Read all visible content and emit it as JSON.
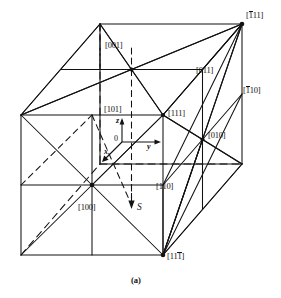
{
  "figure": {
    "caption": "(a)",
    "type": "crystallographic-direction-cube",
    "line_color": "#121212",
    "background_color": "#ffffff"
  },
  "axes": {
    "origin_label": "0",
    "z_label": "z",
    "y_label": "y",
    "x_label": "x",
    "s_label": "S"
  },
  "directions": [
    {
      "id": "d001",
      "prefix": "[",
      "a": "0",
      "a_bar": false,
      "b": "0",
      "b_bar": false,
      "c": "1",
      "c_bar": false,
      "suffix": "]",
      "text": "[001]"
    },
    {
      "id": "d101",
      "prefix": "[",
      "a": "1",
      "a_bar": false,
      "b": "0",
      "b_bar": false,
      "c": "1",
      "c_bar": false,
      "suffix": "]",
      "text": "[101]"
    },
    {
      "id": "d111",
      "prefix": "[",
      "a": "1",
      "a_bar": false,
      "b": "1",
      "b_bar": false,
      "c": "1",
      "c_bar": false,
      "suffix": "]",
      "text": "[111]"
    },
    {
      "id": "d011",
      "prefix": "[",
      "a": "0",
      "a_bar": false,
      "b": "1",
      "b_bar": false,
      "c": "1",
      "c_bar": false,
      "suffix": "]",
      "text": "[011]"
    },
    {
      "id": "dbar111",
      "prefix": "[",
      "a": "1",
      "a_bar": true,
      "b": "1",
      "b_bar": false,
      "c": "1",
      "c_bar": false,
      "suffix": "]",
      "text": "[-111]"
    },
    {
      "id": "dbar110",
      "prefix": "[",
      "a": "1",
      "a_bar": true,
      "b": "1",
      "b_bar": false,
      "c": "0",
      "c_bar": false,
      "suffix": "]",
      "text": "[-110]"
    },
    {
      "id": "d010",
      "prefix": "[",
      "a": "0",
      "a_bar": false,
      "b": "1",
      "b_bar": false,
      "c": "0",
      "c_bar": false,
      "suffix": "]",
      "text": "[010]"
    },
    {
      "id": "d110",
      "prefix": "[",
      "a": "1",
      "a_bar": false,
      "b": "1",
      "b_bar": false,
      "c": "0",
      "c_bar": false,
      "suffix": "]",
      "text": "[110]"
    },
    {
      "id": "d100",
      "prefix": "[",
      "a": "1",
      "a_bar": false,
      "b": "0",
      "b_bar": false,
      "c": "0",
      "c_bar": false,
      "suffix": "]",
      "text": "[100]"
    },
    {
      "id": "d11bar1",
      "prefix": "[",
      "a": "1",
      "a_bar": false,
      "b": "1",
      "b_bar": false,
      "c": "1",
      "c_bar": true,
      "suffix": "]",
      "text": "[11-1]"
    }
  ]
}
